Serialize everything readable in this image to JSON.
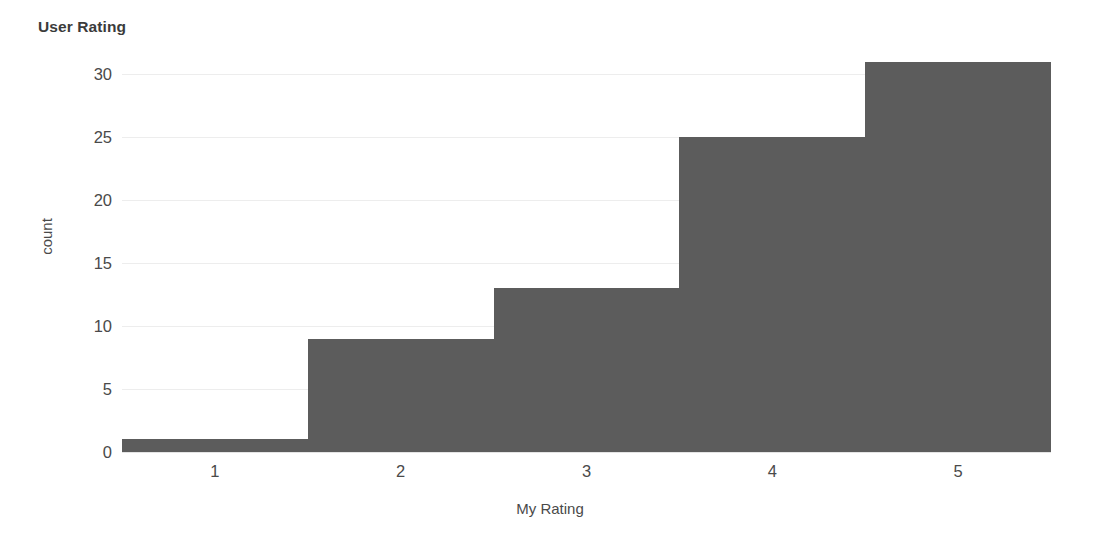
{
  "chart_data": {
    "type": "bar",
    "title": "User Rating",
    "xlabel": "My Rating",
    "ylabel": "count",
    "categories": [
      "1",
      "2",
      "3",
      "4",
      "5"
    ],
    "values": [
      1,
      9,
      13,
      25,
      31
    ],
    "x_tick_labels": [
      "1",
      "2",
      "3",
      "4",
      "5"
    ],
    "y_tick_labels": [
      "0",
      "5",
      "10",
      "15",
      "20",
      "25",
      "30"
    ],
    "y_ticks": [
      0,
      5,
      10,
      15,
      20,
      25,
      30
    ],
    "ylim": [
      0,
      31
    ],
    "xlim": [
      0.5,
      5.5
    ],
    "bin_edges": [
      0.5,
      1.5,
      2.5,
      3.5,
      4.5,
      5.5
    ],
    "grid": true,
    "grid_axis": "y",
    "legend": false,
    "bar_gap": 0,
    "colors": {
      "bar_fill": "#5c5c5c",
      "gridline": "#ededed",
      "title_text": "#3b3b3b",
      "axis_text": "#4a4a4a",
      "background": "#ffffff"
    }
  }
}
